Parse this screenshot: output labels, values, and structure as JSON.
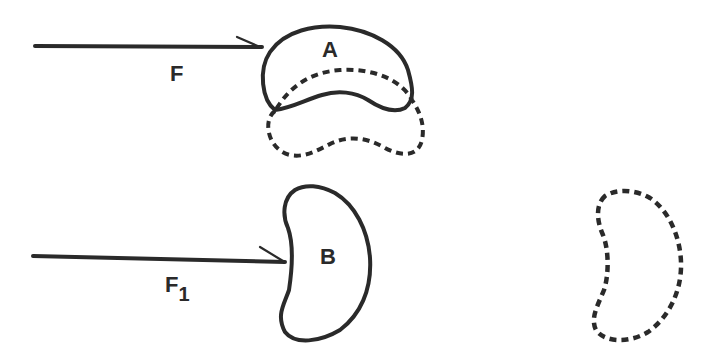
{
  "diagram": {
    "scenario_top": {
      "force_label": "F",
      "body_label": "A",
      "description": "Force F applied to body A; dashed outline shows displaced position"
    },
    "scenario_bottom": {
      "force_label": "F",
      "force_subscript": "1",
      "body_label": "B",
      "description": "Force F1 applied to body B; dashed outline shows displaced position"
    },
    "colors": {
      "stroke": "#2a2a2a",
      "background": "#ffffff"
    }
  }
}
